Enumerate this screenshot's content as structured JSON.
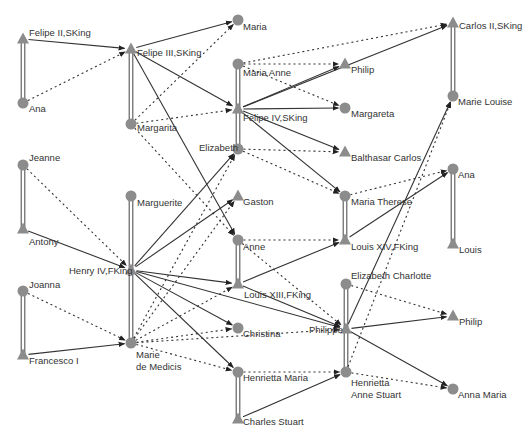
{
  "diagram": {
    "type": "family-tree-genealogy-graph",
    "colors": {
      "node_fill": "#8c8c8c",
      "solid_edge": "#333333",
      "dotted_edge": "#333333",
      "marriage_edge": "#555555",
      "label": "#333333",
      "background": "#ffffff"
    },
    "legend_semantics": {
      "triangle": "male",
      "circle": "female",
      "solid_arrow": "father-to-child",
      "dotted_arrow": "mother-to-child",
      "double_line": "marriage"
    },
    "nodes": [
      {
        "id": "felipe2",
        "label": "Felipe II,SKing",
        "shape": "triangle",
        "x": 23,
        "y": 39,
        "lx": 29,
        "ly": 36,
        "lines": [
          "Felipe II,SKing"
        ]
      },
      {
        "id": "ana1",
        "label": "Ana",
        "shape": "circle",
        "x": 23,
        "y": 103,
        "lx": 29,
        "ly": 112,
        "lines": [
          "Ana"
        ]
      },
      {
        "id": "felipe3",
        "label": "Felipe III,SKing",
        "shape": "triangle",
        "x": 131,
        "y": 49,
        "lx": 137,
        "ly": 56,
        "lines": [
          "Felipe III,SKing"
        ]
      },
      {
        "id": "margarita",
        "label": "Margarita",
        "shape": "circle",
        "x": 131,
        "y": 124,
        "lx": 137,
        "ly": 131,
        "lines": [
          "Margarita"
        ]
      },
      {
        "id": "maria",
        "label": "Maria",
        "shape": "circle",
        "x": 238,
        "y": 20,
        "lx": 243,
        "ly": 30,
        "lines": [
          "Maria"
        ]
      },
      {
        "id": "mariaanne",
        "label": "Maria Anne",
        "shape": "circle",
        "x": 238,
        "y": 64,
        "lx": 243,
        "ly": 76,
        "lines": [
          "Maria Anne"
        ]
      },
      {
        "id": "felipe4",
        "label": "Felipe IV,SKing",
        "shape": "triangle",
        "x": 238,
        "y": 109,
        "lx": 243,
        "ly": 121,
        "lines": [
          "Felipe IV,SKing"
        ]
      },
      {
        "id": "elizabeth",
        "label": "Elizabeth",
        "shape": "circle",
        "x": 238,
        "y": 149,
        "lx": 199,
        "ly": 151,
        "lines": [
          "Elizabeth"
        ]
      },
      {
        "id": "philip1",
        "label": "Philip",
        "shape": "triangle",
        "x": 345,
        "y": 64,
        "lx": 351,
        "ly": 73,
        "lines": [
          "Philip"
        ]
      },
      {
        "id": "margareta",
        "label": "Margareta",
        "shape": "circle",
        "x": 345,
        "y": 108,
        "lx": 351,
        "ly": 117,
        "lines": [
          "Margareta"
        ]
      },
      {
        "id": "balthasar",
        "label": "Balthasar Carlos",
        "shape": "triangle",
        "x": 345,
        "y": 152,
        "lx": 351,
        "ly": 161,
        "lines": [
          "Balthasar Carlos"
        ]
      },
      {
        "id": "carlos2",
        "label": "Carlos II,SKing",
        "shape": "triangle",
        "x": 453,
        "y": 23,
        "lx": 459,
        "ly": 29,
        "lines": [
          "Carlos II,SKing"
        ]
      },
      {
        "id": "marielouise",
        "label": "Marie Louise",
        "shape": "circle",
        "x": 453,
        "y": 96,
        "lx": 458,
        "ly": 105,
        "lines": [
          "Marie Louise"
        ]
      },
      {
        "id": "jeanne",
        "label": "Jeanne",
        "shape": "circle",
        "x": 23,
        "y": 165,
        "lx": 29,
        "ly": 161,
        "lines": [
          "Jeanne"
        ]
      },
      {
        "id": "antony",
        "label": "Antony",
        "shape": "triangle",
        "x": 23,
        "y": 229,
        "lx": 29,
        "ly": 245,
        "lines": [
          "Antony"
        ]
      },
      {
        "id": "marguerite",
        "label": "Marguerite",
        "shape": "circle",
        "x": 131,
        "y": 196,
        "lx": 137,
        "ly": 206,
        "lines": [
          "Marguerite"
        ]
      },
      {
        "id": "henry4",
        "label": "Henry IV,FKing",
        "shape": "triangle",
        "x": 131,
        "y": 270,
        "lx": 69,
        "ly": 274,
        "lines": [
          "Henry IV,FKing"
        ]
      },
      {
        "id": "gaston",
        "label": "Gaston",
        "shape": "triangle",
        "x": 238,
        "y": 196,
        "lx": 243,
        "ly": 205,
        "lines": [
          "Gaston"
        ]
      },
      {
        "id": "anne",
        "label": "Anne",
        "shape": "circle",
        "x": 238,
        "y": 240,
        "lx": 243,
        "ly": 250,
        "lines": [
          "Anne"
        ]
      },
      {
        "id": "louis13",
        "label": "Louis XIII,FKing",
        "shape": "triangle",
        "x": 238,
        "y": 284,
        "lx": 244,
        "ly": 298,
        "lines": [
          "Louis XIII,FKing"
        ]
      },
      {
        "id": "mariatherese",
        "label": "Maria Therese",
        "shape": "circle",
        "x": 345,
        "y": 196,
        "lx": 351,
        "ly": 205,
        "lines": [
          "Maria Therese"
        ]
      },
      {
        "id": "louis14",
        "label": "Louis XIV,FKing",
        "shape": "triangle",
        "x": 345,
        "y": 240,
        "lx": 351,
        "ly": 250,
        "lines": [
          "Louis XIV,FKing"
        ]
      },
      {
        "id": "ana2",
        "label": "Ana",
        "shape": "circle",
        "x": 453,
        "y": 169,
        "lx": 458,
        "ly": 178,
        "lines": [
          "Ana"
        ]
      },
      {
        "id": "louis",
        "label": "Louis",
        "shape": "triangle",
        "x": 453,
        "y": 244,
        "lx": 459,
        "ly": 253,
        "lines": [
          "Louis"
        ]
      },
      {
        "id": "joanna",
        "label": "Joanna",
        "shape": "circle",
        "x": 23,
        "y": 291,
        "lx": 29,
        "ly": 288,
        "lines": [
          "Joanna"
        ]
      },
      {
        "id": "francesco",
        "label": "Francesco I",
        "shape": "triangle",
        "x": 23,
        "y": 355,
        "lx": 29,
        "ly": 364,
        "lines": [
          "Francesco I"
        ]
      },
      {
        "id": "mariedemedicis",
        "label": "Marie de Medicis",
        "shape": "circle",
        "x": 131,
        "y": 343,
        "lx": 136,
        "ly": 358,
        "lines": [
          "Marie",
          "de Medicis"
        ]
      },
      {
        "id": "christina",
        "label": "Christina",
        "shape": "circle",
        "x": 238,
        "y": 328,
        "lx": 243,
        "ly": 337,
        "lines": [
          "Christina"
        ]
      },
      {
        "id": "henriettamaria",
        "label": "Henrietta Maria",
        "shape": "circle",
        "x": 238,
        "y": 372,
        "lx": 243,
        "ly": 381,
        "lines": [
          "Henrietta Maria"
        ]
      },
      {
        "id": "charlesstuart",
        "label": "Charles Stuart",
        "shape": "triangle",
        "x": 238,
        "y": 419,
        "lx": 243,
        "ly": 425,
        "lines": [
          "Charles Stuart"
        ]
      },
      {
        "id": "elizabethcharlotte",
        "label": "Elizabeth Charlotte",
        "shape": "circle",
        "x": 346,
        "y": 284,
        "lx": 351,
        "ly": 279,
        "lines": [
          "Elizabeth Charlotte"
        ]
      },
      {
        "id": "philippe",
        "label": "Philippe",
        "shape": "triangle",
        "x": 346,
        "y": 329,
        "lx": 309,
        "ly": 333,
        "lines": [
          "Philippe"
        ]
      },
      {
        "id": "henriettaannestuart",
        "label": "Henrietta Anne Stuart",
        "shape": "circle",
        "x": 346,
        "y": 372,
        "lx": 351,
        "ly": 386,
        "lines": [
          "Henrietta",
          "Anne Stuart"
        ]
      },
      {
        "id": "philip2",
        "label": "Philip",
        "shape": "triangle",
        "x": 453,
        "y": 316,
        "lx": 459,
        "ly": 325,
        "lines": [
          "Philip"
        ]
      },
      {
        "id": "annamaria",
        "label": "Anna Maria",
        "shape": "circle",
        "x": 453,
        "y": 389,
        "lx": 458,
        "ly": 398,
        "lines": [
          "Anna Maria"
        ]
      }
    ],
    "marriages": [
      [
        "felipe2",
        "ana1"
      ],
      [
        "felipe3",
        "margarita"
      ],
      [
        "mariaanne",
        "felipe4"
      ],
      [
        "felipe4",
        "elizabeth"
      ],
      [
        "carlos2",
        "marielouise"
      ],
      [
        "jeanne",
        "antony"
      ],
      [
        "marguerite",
        "henry4"
      ],
      [
        "henry4",
        "mariedemedicis"
      ],
      [
        "anne",
        "louis13"
      ],
      [
        "mariatherese",
        "louis14"
      ],
      [
        "ana2",
        "louis"
      ],
      [
        "joanna",
        "francesco"
      ],
      [
        "henriettamaria",
        "charlesstuart"
      ],
      [
        "elizabethcharlotte",
        "philippe"
      ],
      [
        "philippe",
        "henriettaannestuart"
      ]
    ],
    "father_edges": [
      [
        "felipe2",
        "felipe3"
      ],
      [
        "felipe3",
        "maria"
      ],
      [
        "felipe3",
        "felipe4"
      ],
      [
        "felipe3",
        "anne"
      ],
      [
        "felipe4",
        "philip1"
      ],
      [
        "felipe4",
        "carlos2"
      ],
      [
        "felipe4",
        "margareta"
      ],
      [
        "felipe4",
        "balthasar"
      ],
      [
        "felipe4",
        "mariatherese"
      ],
      [
        "antony",
        "henry4"
      ],
      [
        "henry4",
        "elizabeth"
      ],
      [
        "henry4",
        "gaston"
      ],
      [
        "henry4",
        "louis13"
      ],
      [
        "henry4",
        "christina"
      ],
      [
        "henry4",
        "henriettamaria"
      ],
      [
        "henry4",
        "philippe"
      ],
      [
        "francesco",
        "mariedemedicis"
      ],
      [
        "louis13",
        "louis14"
      ],
      [
        "louis13",
        "philippe"
      ],
      [
        "louis14",
        "ana2"
      ],
      [
        "philippe",
        "marielouise"
      ],
      [
        "philippe",
        "philip2"
      ],
      [
        "philippe",
        "annamaria"
      ],
      [
        "charlesstuart",
        "henriettaannestuart"
      ]
    ],
    "mother_edges": [
      [
        "ana1",
        "felipe3"
      ],
      [
        "margarita",
        "maria"
      ],
      [
        "margarita",
        "felipe4"
      ],
      [
        "margarita",
        "anne"
      ],
      [
        "mariaanne",
        "philip1"
      ],
      [
        "mariaanne",
        "carlos2"
      ],
      [
        "mariaanne",
        "margareta"
      ],
      [
        "elizabeth",
        "balthasar"
      ],
      [
        "elizabeth",
        "mariatherese"
      ],
      [
        "jeanne",
        "henry4"
      ],
      [
        "joanna",
        "mariedemedicis"
      ],
      [
        "mariedemedicis",
        "elizabeth"
      ],
      [
        "mariedemedicis",
        "gaston"
      ],
      [
        "mariedemedicis",
        "louis13"
      ],
      [
        "mariedemedicis",
        "christina"
      ],
      [
        "mariedemedicis",
        "henriettamaria"
      ],
      [
        "mariedemedicis",
        "philippe"
      ],
      [
        "anne",
        "louis14"
      ],
      [
        "anne",
        "philippe"
      ],
      [
        "mariatherese",
        "ana2"
      ],
      [
        "henriettamaria",
        "henriettaannestuart"
      ],
      [
        "henriettaannestuart",
        "marielouise"
      ],
      [
        "henriettaannestuart",
        "annamaria"
      ],
      [
        "elizabethcharlotte",
        "philip2"
      ]
    ]
  }
}
